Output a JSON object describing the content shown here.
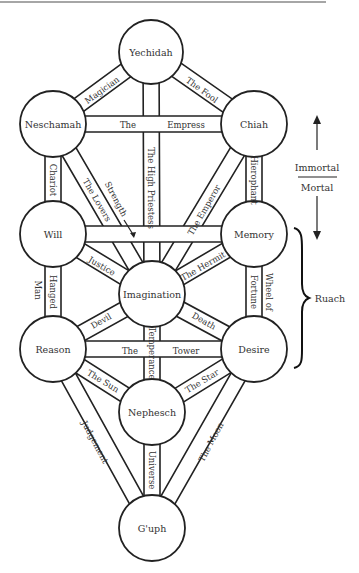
{
  "diagram": {
    "nodes": [
      {
        "id": "yechidah",
        "label": "Yechidah",
        "cx": 151,
        "cy": 52,
        "r": 32
      },
      {
        "id": "neschamah",
        "label": "Neschamah",
        "cx": 53,
        "cy": 124,
        "r": 33
      },
      {
        "id": "chiah",
        "label": "Chiah",
        "cx": 254,
        "cy": 124,
        "r": 33
      },
      {
        "id": "will",
        "label": "Will",
        "cx": 53,
        "cy": 234,
        "r": 33
      },
      {
        "id": "memory",
        "label": "Memory",
        "cx": 254,
        "cy": 234,
        "r": 33
      },
      {
        "id": "imagination",
        "label": "Imagination",
        "cx": 152,
        "cy": 294,
        "r": 33
      },
      {
        "id": "reason",
        "label": "Reason",
        "cx": 53,
        "cy": 349,
        "r": 33
      },
      {
        "id": "desire",
        "label": "Desire",
        "cx": 254,
        "cy": 349,
        "r": 33
      },
      {
        "id": "nephesch",
        "label": "Nephesch",
        "cx": 152,
        "cy": 412,
        "r": 33
      },
      {
        "id": "guph",
        "label": "G'uph",
        "cx": 152,
        "cy": 528,
        "r": 33
      }
    ],
    "paths": [
      {
        "id": "magician",
        "from": "yechidah",
        "to": "neschamah",
        "label": "Magician"
      },
      {
        "id": "the-fool",
        "from": "yechidah",
        "to": "chiah",
        "label": "The Fool"
      },
      {
        "id": "high-priestess",
        "from": "yechidah",
        "to": "imagination",
        "label": "The High Priestess"
      },
      {
        "id": "empress",
        "from": "neschamah",
        "to": "chiah",
        "label": "The Empress",
        "label_left": "The",
        "label_right": "Empress"
      },
      {
        "id": "chariot",
        "from": "neschamah",
        "to": "will",
        "label": "Chariot"
      },
      {
        "id": "lovers",
        "from": "neschamah",
        "to": "imagination",
        "label": "The Lovers"
      },
      {
        "id": "emperor",
        "from": "chiah",
        "to": "imagination",
        "label": "The Emperor"
      },
      {
        "id": "hierophant",
        "from": "chiah",
        "to": "memory",
        "label": "Hierophant"
      },
      {
        "id": "strength",
        "from": "will",
        "to": "memory",
        "label": "Strength"
      },
      {
        "id": "justice",
        "from": "will",
        "to": "imagination",
        "label": "Justice"
      },
      {
        "id": "hanged-man",
        "from": "will",
        "to": "reason",
        "label": "Hanged Man",
        "label_line1": "Hanged",
        "label_line2": "Man"
      },
      {
        "id": "hermit",
        "from": "memory",
        "to": "imagination",
        "label": "The Hermit"
      },
      {
        "id": "wheel-of-fortune",
        "from": "memory",
        "to": "desire",
        "label": "Wheel of Fortune",
        "label_line1": "Wheel of",
        "label_line2": "Fortune"
      },
      {
        "id": "devil",
        "from": "imagination",
        "to": "reason",
        "label": "Devil"
      },
      {
        "id": "death",
        "from": "imagination",
        "to": "desire",
        "label": "Death"
      },
      {
        "id": "temperance",
        "from": "imagination",
        "to": "nephesch",
        "label": "Temperance"
      },
      {
        "id": "tower",
        "from": "reason",
        "to": "desire",
        "label": "The Tower",
        "label_left": "The",
        "label_right": "Tower"
      },
      {
        "id": "sun",
        "from": "reason",
        "to": "nephesch",
        "label": "The Sun"
      },
      {
        "id": "star",
        "from": "desire",
        "to": "nephesch",
        "label": "The Star"
      },
      {
        "id": "judgement",
        "from": "reason",
        "to": "guph",
        "label": "Judgement"
      },
      {
        "id": "moon",
        "from": "desire",
        "to": "guph",
        "label": "The Moon"
      },
      {
        "id": "universe",
        "from": "nephesch",
        "to": "guph",
        "label": "Universe"
      }
    ],
    "annotations": {
      "immortal": "Immortal",
      "mortal": "Mortal",
      "ruach": "Ruach"
    },
    "caption": "Figure: Tree of Life (partially visible)"
  }
}
